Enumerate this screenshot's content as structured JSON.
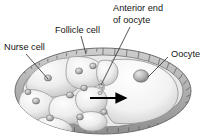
{
  "figure": {
    "background_color": "#ffffff",
    "ink_color": "#2a2a2a",
    "labels": [
      {
        "id": "nurse-cell",
        "text": "Nurse cell",
        "x": 4,
        "y": 48
      },
      {
        "id": "follicle-cell",
        "text": "Follicle cell",
        "x": 55,
        "y": 31
      },
      {
        "id": "anterior-end-1",
        "text": "Anterior end",
        "x": 113,
        "y": 9
      },
      {
        "id": "anterior-end-2",
        "text": "of oocyte",
        "x": 113,
        "y": 21
      },
      {
        "id": "oocyte",
        "text": "Oocyte",
        "x": 171,
        "y": 55
      }
    ],
    "leaders": [
      {
        "id": "leader-nurse-cell",
        "x1": 26,
        "y1": 54,
        "x2": 48,
        "y2": 79
      },
      {
        "id": "leader-follicle-cell",
        "x1": 81,
        "y1": 36,
        "x2": 86,
        "y2": 54
      },
      {
        "id": "leader-anterior-end",
        "x1": 130,
        "y1": 27,
        "x2": 101,
        "y2": 85
      },
      {
        "id": "leader-oocyte",
        "x1": 168,
        "y1": 57,
        "x2": 148,
        "y2": 77
      }
    ],
    "arrow": {
      "id": "transport-arrow",
      "x1": 90,
      "y1": 98,
      "x2": 126,
      "y2": 98,
      "direction": "right"
    },
    "structures": {
      "follicle_epithelium": "ridged outer layer of follicle cells surrounding the chamber",
      "nurse_cells_count": 8,
      "oocyte_position": "posterior right",
      "oocyte_nucleus": "small sphere in oocyte",
      "ring_canal": "connection between nurse cell cluster and oocyte"
    }
  }
}
